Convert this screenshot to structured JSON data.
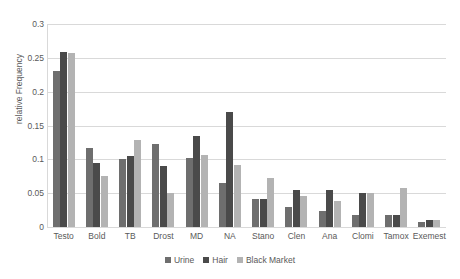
{
  "chart_data": {
    "type": "bar",
    "title": "",
    "subtitle": "",
    "xlabel": "",
    "ylabel": "relative Frequency",
    "ylim": [
      0,
      0.3
    ],
    "yticks": [
      "0",
      "0.05",
      "0.1",
      "0.15",
      "0.2",
      "0.25",
      "0.3"
    ],
    "ytick_values": [
      0,
      0.05,
      0.1,
      0.15,
      0.2,
      0.25,
      0.3
    ],
    "grid": true,
    "legend_position": "bottom",
    "categories": [
      "Testo",
      "Bold",
      "TB",
      "Drost",
      "MD",
      "NA",
      "Stano",
      "Clen",
      "Ana",
      "Clomi",
      "Tamox",
      "Exemest"
    ],
    "series": [
      {
        "name": "Urine",
        "color": "#6e6e6e",
        "values": [
          0.231,
          0.117,
          0.101,
          0.123,
          0.102,
          0.065,
          0.041,
          0.03,
          0.024,
          0.018,
          0.018,
          0.008
        ]
      },
      {
        "name": "Hair",
        "color": "#4a4a4a",
        "values": [
          0.259,
          0.095,
          0.105,
          0.09,
          0.135,
          0.17,
          0.042,
          0.055,
          0.054,
          0.05,
          0.018,
          0.01
        ]
      },
      {
        "name": "Black Market",
        "color": "#b3b3b3",
        "values": [
          0.257,
          0.075,
          0.129,
          0.051,
          0.106,
          0.091,
          0.073,
          0.046,
          0.038,
          0.05,
          0.057,
          0.01
        ]
      }
    ]
  }
}
